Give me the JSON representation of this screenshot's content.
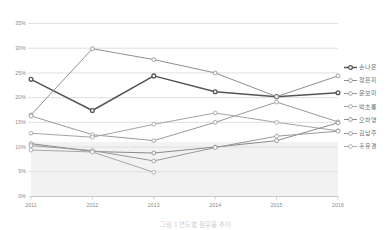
{
  "chart_data": {
    "type": "line",
    "title": "",
    "subtitle": "",
    "xlabel": "",
    "ylabel": "",
    "categories": [
      "2011",
      "2012",
      "2013",
      "2014",
      "2015",
      "2016"
    ],
    "x_tick_labels": [
      "2011",
      "2012",
      "2013",
      "2014",
      "2015",
      "2016"
    ],
    "y_tick_labels": [
      "0%",
      "5%",
      "10%",
      "15%",
      "20%",
      "25%",
      "30%",
      "35%"
    ],
    "y_tick_values": [
      0,
      5,
      10,
      15,
      20,
      25,
      30,
      35
    ],
    "ylim": [
      0,
      35
    ],
    "y_unit": "%",
    "grid": "horizontal",
    "legend_position": "right",
    "marker": "open-circle",
    "shaded_band": {
      "from": 0,
      "to": 11,
      "color": "#f2f2f2"
    },
    "series": [
      {
        "name": "손나은",
        "color": "#555555",
        "width": 1.5,
        "values": [
          23.7,
          17.4,
          24.4,
          21.2,
          20.2,
          21.0
        ]
      },
      {
        "name": "정은지",
        "color": "#8f8f8f",
        "width": 1.0,
        "values": [
          16.5,
          29.9,
          27.7,
          25.0,
          20.2,
          24.4
        ]
      },
      {
        "name": "윤보미",
        "color": "#9a9a9a",
        "width": 1.0,
        "values": [
          16.3,
          12.5,
          11.3,
          15.0,
          19.1,
          15.1
        ]
      },
      {
        "name": "박초롱",
        "color": "#a3a3a3",
        "width": 1.0,
        "values": [
          12.8,
          12.0,
          14.6,
          16.9,
          15.0,
          13.3
        ]
      },
      {
        "name": "오하영",
        "color": "#8b8b8b",
        "width": 1.0,
        "values": [
          10.7,
          9.1,
          8.8,
          10.0,
          11.3,
          14.9
        ]
      },
      {
        "name": "김남주",
        "color": "#999999",
        "width": 1.0,
        "values": [
          10.3,
          9.3,
          7.2,
          9.9,
          12.2,
          13.2
        ]
      },
      {
        "name": "홍유경",
        "color": "#a8a8a8",
        "width": 1.0,
        "values": [
          9.4,
          9.0,
          4.9,
          null,
          null,
          null
        ]
      }
    ]
  },
  "legend": {
    "items": [
      {
        "label": "손나은"
      },
      {
        "label": "정은지"
      },
      {
        "label": "윤보미"
      },
      {
        "label": "박초롱"
      },
      {
        "label": "오하영"
      },
      {
        "label": "김남주"
      },
      {
        "label": "홍유경"
      }
    ]
  },
  "caption": {
    "text": "그림 1  연도별 점유율 추이"
  },
  "colors": {
    "grid": "#d8d8d8",
    "axis_text": "#8a8a8a",
    "legend_text": "#6f6f6f",
    "band": "#f2f2f2",
    "background": "#ffffff"
  }
}
